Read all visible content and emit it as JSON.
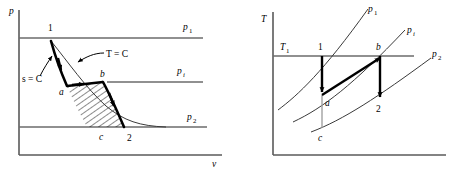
{
  "figure": {
    "type": "thermodynamic-process-diagrams",
    "panels": [
      {
        "id": "pv-diagram",
        "name": "pressure-volume-diagram",
        "axes": {
          "y_label": "p",
          "x_label": "v"
        },
        "pressure_lines": [
          {
            "key": "p1",
            "label": "p",
            "sub": "1"
          },
          {
            "key": "pi",
            "label": "p",
            "sub": "i"
          },
          {
            "key": "p2",
            "label": "p",
            "sub": "2"
          }
        ],
        "annotations": [
          {
            "key": "s_const",
            "text": "s = C"
          },
          {
            "key": "t_const",
            "text": "T = C"
          }
        ],
        "state_points": [
          {
            "key": "p1_pt",
            "label": "1"
          },
          {
            "key": "a_pt",
            "label": "a"
          },
          {
            "key": "b_pt",
            "label": "b"
          },
          {
            "key": "c_pt",
            "label": "c"
          },
          {
            "key": "p2_pt",
            "label": "2"
          }
        ]
      },
      {
        "id": "ts-diagram",
        "name": "temperature-entropy-diagram",
        "axes": {
          "y_label": "T"
        },
        "isobar_lines": [
          {
            "key": "p1",
            "label": "p",
            "sub": "1"
          },
          {
            "key": "pi",
            "label": "p",
            "sub": "i"
          },
          {
            "key": "p2",
            "label": "p",
            "sub": "2"
          }
        ],
        "temperature_line": {
          "label": "T",
          "sub": "1"
        },
        "state_points": [
          {
            "key": "p1_pt",
            "label": "1"
          },
          {
            "key": "a_pt",
            "label": "a"
          },
          {
            "key": "b_pt",
            "label": "b"
          },
          {
            "key": "c_pt",
            "label": "c"
          },
          {
            "key": "p2_pt",
            "label": "2"
          }
        ]
      }
    ],
    "colors": {
      "stroke": "#000000",
      "axis": "#5a5a5a",
      "iso": "#6b6b6b",
      "gray": "#9a9a9a",
      "background": "#ffffff"
    }
  }
}
